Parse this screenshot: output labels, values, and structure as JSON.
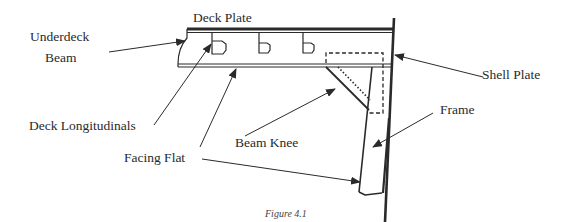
{
  "figure": {
    "caption": "Figure 4.1"
  },
  "labels": {
    "underdeck_beam_line1": "Underdeck",
    "underdeck_beam_line2": "Beam",
    "deck_plate": "Deck Plate",
    "shell_plate": "Shell Plate",
    "frame": "Frame",
    "deck_longitudinals": "Deck Longitudinals",
    "beam_knee": "Beam Knee",
    "facing_flat": "Facing Flat"
  },
  "colors": {
    "line": "#2a2a2a",
    "background": "#ffffff"
  }
}
